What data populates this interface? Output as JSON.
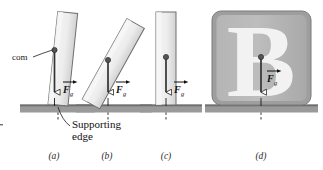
{
  "figure": {
    "colors": {
      "block_fill": "#e8e8e8",
      "block_fill_dark": "#b9b9b9",
      "block_stroke": "#6e6e6e",
      "ground_fill": "#9a9a9a",
      "ground_top": "#6f6f6f",
      "line": "#1a1a1a",
      "text": "#1a1a1a",
      "letter_b": "#f2f2f2"
    }
  },
  "labels": {
    "com": "com",
    "supporting_edge_line1": "Supporting",
    "supporting_edge_line2": "edge",
    "force_symbol": "F",
    "force_subscript": "g"
  },
  "panels": [
    {
      "id": "a",
      "caption": "(a)",
      "description": "Block tilted slightly, com still over supporting edge",
      "tilt_degrees": 5,
      "force_label": "F",
      "force_subscript": "g"
    },
    {
      "id": "b",
      "caption": "(b)",
      "description": "Block tilted strongly, com beyond supporting edge",
      "tilt_degrees": 28,
      "force_label": "F",
      "force_subscript": "g"
    },
    {
      "id": "c",
      "caption": "(c)",
      "description": "Block upright, com over base",
      "tilt_degrees": 0,
      "force_label": "F",
      "force_subscript": "g"
    },
    {
      "id": "d",
      "caption": "(d)",
      "description": "Wide block with letter B, com well inside base",
      "tilt_degrees": 0,
      "letter": "B",
      "force_label": "F",
      "force_subscript": "g"
    }
  ]
}
